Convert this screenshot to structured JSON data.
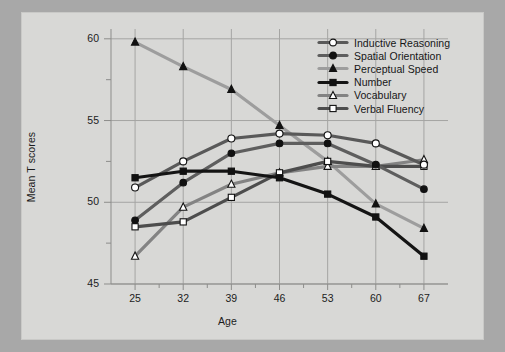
{
  "figure": {
    "background_color": "#a8a8a8",
    "plate_color": "#d8d8d6"
  },
  "chart_data": {
    "type": "line",
    "title": "",
    "xlabel": "Age",
    "ylabel": "Mean T scores",
    "categories": [
      "25",
      "32",
      "39",
      "46",
      "53",
      "60",
      "67"
    ],
    "x": [
      25,
      32,
      39,
      46,
      53,
      60,
      67
    ],
    "xlim": [
      21.5,
      70.5
    ],
    "ylim": [
      45,
      60.6
    ],
    "yticks": [
      "45",
      "50",
      "55",
      "60"
    ],
    "ytick_values": [
      45,
      50,
      55,
      60
    ],
    "y_minor_ticks": [
      47.5,
      52.5,
      57.5
    ],
    "grid": true,
    "legend_position": "upper right",
    "series": [
      {
        "name": "Inductive Reasoning",
        "color": "#595959",
        "marker": "circle-open",
        "marker_fill": "#ffffff",
        "values": [
          50.9,
          52.5,
          53.9,
          54.2,
          54.1,
          53.6,
          52.3
        ]
      },
      {
        "name": "Spatial Orientation",
        "color": "#5e5e5e",
        "marker": "circle-filled",
        "marker_fill": "#111111",
        "values": [
          48.9,
          51.2,
          53.0,
          53.6,
          53.6,
          52.3,
          50.8
        ]
      },
      {
        "name": "Perceptual Speed",
        "color": "#9d9d9d",
        "marker": "triangle-filled",
        "marker_fill": "#111111",
        "values": [
          59.8,
          58.3,
          56.9,
          54.7,
          52.5,
          49.9,
          48.4
        ]
      },
      {
        "name": "Number",
        "color": "#141414",
        "marker": "square-filled",
        "marker_fill": "#111111",
        "values": [
          51.5,
          51.9,
          51.9,
          51.5,
          50.5,
          49.1,
          46.7
        ]
      },
      {
        "name": "Vocabulary",
        "color": "#838383",
        "marker": "triangle-open",
        "marker_fill": "#ffffff",
        "values": [
          46.7,
          49.7,
          51.1,
          51.8,
          52.2,
          52.2,
          52.6
        ]
      },
      {
        "name": "Verbal Fluency",
        "color": "#4d4d4d",
        "marker": "square-open",
        "marker_fill": "#ffffff",
        "values": [
          48.5,
          48.8,
          50.3,
          51.8,
          52.5,
          52.2,
          52.2
        ]
      }
    ]
  }
}
